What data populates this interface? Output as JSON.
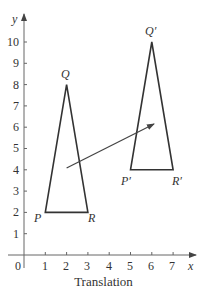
{
  "diagram": {
    "caption": "Translation",
    "axes": {
      "x_label": "x",
      "y_label": "y",
      "origin_label": "0",
      "x_ticks": [
        "1",
        "2",
        "3",
        "4",
        "5",
        "6",
        "7"
      ],
      "y_ticks": [
        "1",
        "2",
        "3",
        "4",
        "5",
        "6",
        "7",
        "8",
        "9",
        "10"
      ]
    },
    "original_triangle": {
      "vertices": [
        {
          "label": "P",
          "x": 1,
          "y": 2
        },
        {
          "label": "Q",
          "x": 2,
          "y": 8
        },
        {
          "label": "R",
          "x": 3,
          "y": 2
        }
      ]
    },
    "image_triangle": {
      "vertices": [
        {
          "label": "P′",
          "x": 5,
          "y": 4
        },
        {
          "label": "Q′",
          "x": 6,
          "y": 10
        },
        {
          "label": "R′",
          "x": 7,
          "y": 4
        }
      ]
    },
    "translation_vector": {
      "from": [
        2,
        4.1
      ],
      "to": [
        6,
        6.1
      ]
    },
    "colors": {
      "line": "#333333",
      "axis": "#555555",
      "background": "#ffffff"
    }
  }
}
